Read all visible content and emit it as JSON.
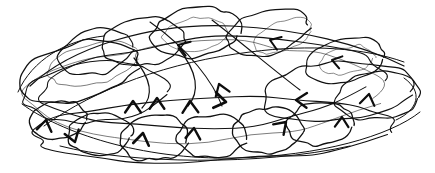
{
  "image": {
    "kind": "hand-drawn-ink-scribble",
    "title": "Scribbled tangle of overlapping loops with arrowheads",
    "width": 435,
    "height": 173,
    "background_color": "#ffffff",
    "ink_color": "#111111",
    "medium": "ballpoint pen on white paper",
    "visible_text": "",
    "loop_count": 22,
    "arrow_count": 14
  },
  "strokes": {
    "loops": [
      {
        "name": "loop-top-left-outer",
        "cx": 78,
        "cy": 72,
        "rx": 62,
        "ry": 28,
        "rot": -14,
        "w": 1.3,
        "faint": false
      },
      {
        "name": "loop-top-left-inner",
        "cx": 92,
        "cy": 64,
        "rx": 46,
        "ry": 21,
        "rot": -13,
        "w": 1.0,
        "faint": true
      },
      {
        "name": "loop-upper-left-small",
        "cx": 96,
        "cy": 52,
        "rx": 38,
        "ry": 22,
        "rot": -16,
        "w": 1.2,
        "faint": false
      },
      {
        "name": "loop-top-mid-left",
        "cx": 143,
        "cy": 42,
        "rx": 42,
        "ry": 24,
        "rot": -10,
        "w": 1.2,
        "faint": false
      },
      {
        "name": "loop-top-center",
        "cx": 196,
        "cy": 32,
        "rx": 44,
        "ry": 25,
        "rot": -7,
        "w": 1.3,
        "faint": false
      },
      {
        "name": "loop-top-center-inner",
        "cx": 196,
        "cy": 34,
        "rx": 33,
        "ry": 17,
        "rot": -7,
        "w": 0.9,
        "faint": true
      },
      {
        "name": "loop-top-right-of-center",
        "cx": 268,
        "cy": 32,
        "rx": 42,
        "ry": 22,
        "rot": -17,
        "w": 1.2,
        "faint": false
      },
      {
        "name": "loop-top-right",
        "cx": 283,
        "cy": 36,
        "rx": 31,
        "ry": 15,
        "rot": -20,
        "w": 0.9,
        "faint": true
      },
      {
        "name": "loop-right-upper",
        "cx": 345,
        "cy": 60,
        "rx": 40,
        "ry": 22,
        "rot": -12,
        "w": 1.2,
        "faint": false
      },
      {
        "name": "loop-right-upper-inner",
        "cx": 348,
        "cy": 60,
        "rx": 28,
        "ry": 14,
        "rot": -12,
        "w": 0.9,
        "faint": true
      },
      {
        "name": "loop-right-mid-big",
        "cx": 338,
        "cy": 92,
        "rx": 78,
        "ry": 30,
        "rot": -5,
        "w": 1.2,
        "faint": false
      },
      {
        "name": "loop-right-far",
        "cx": 378,
        "cy": 96,
        "rx": 42,
        "ry": 24,
        "rot": -6,
        "w": 1.2,
        "faint": false
      },
      {
        "name": "loop-center-wide",
        "cx": 210,
        "cy": 83,
        "rx": 170,
        "ry": 44,
        "rot": -4,
        "w": 1.1,
        "faint": false
      },
      {
        "name": "loop-center-wide-2",
        "cx": 205,
        "cy": 92,
        "rx": 178,
        "ry": 48,
        "rot": -2,
        "w": 1.0,
        "faint": true
      },
      {
        "name": "loop-left-mid",
        "cx": 95,
        "cy": 92,
        "rx": 72,
        "ry": 30,
        "rot": -6,
        "w": 1.1,
        "faint": false
      },
      {
        "name": "loop-bottom-left-small",
        "cx": 58,
        "cy": 120,
        "rx": 29,
        "ry": 19,
        "rot": -8,
        "w": 1.3,
        "faint": false
      },
      {
        "name": "loop-bottom-left-2",
        "cx": 100,
        "cy": 134,
        "rx": 33,
        "ry": 21,
        "rot": -5,
        "w": 1.3,
        "faint": false
      },
      {
        "name": "loop-bottom-mid-left",
        "cx": 155,
        "cy": 138,
        "rx": 35,
        "ry": 23,
        "rot": -3,
        "w": 1.3,
        "faint": false
      },
      {
        "name": "loop-bottom-center",
        "cx": 212,
        "cy": 136,
        "rx": 35,
        "ry": 22,
        "rot": -3,
        "w": 1.3,
        "faint": false
      },
      {
        "name": "loop-bottom-center-right",
        "cx": 268,
        "cy": 130,
        "rx": 36,
        "ry": 22,
        "rot": -4,
        "w": 1.3,
        "faint": false
      },
      {
        "name": "loop-bottom-right",
        "cx": 320,
        "cy": 124,
        "rx": 34,
        "ry": 21,
        "rot": -6,
        "w": 1.3,
        "faint": false
      },
      {
        "name": "loop-bottom-sweep",
        "cx": 215,
        "cy": 130,
        "rx": 180,
        "ry": 32,
        "rot": -2,
        "w": 1.1,
        "faint": false
      }
    ],
    "arcs": [
      {
        "name": "arc-sweep-upper",
        "d": "M 30 86 C 70 48 150 22 232 26 C 300 29 360 44 404 66",
        "w": 1.2
      },
      {
        "name": "arc-sweep-lower",
        "d": "M 22 104 C 60 132 140 160 235 158 C 320 156 390 136 420 112",
        "w": 1.0
      },
      {
        "name": "arc-diagonal-1",
        "d": "M 44 126 C 96 88 170 62 250 52 C 310 44 365 48 404 62",
        "w": 1.0
      },
      {
        "name": "arc-diagonal-2",
        "d": "M 150 22 C 190 50 214 84 222 106",
        "w": 1.1
      },
      {
        "name": "arc-diagonal-3",
        "d": "M 212 20 C 248 48 276 72 300 90",
        "w": 1.1
      },
      {
        "name": "arc-curl-left",
        "d": "M 18 92 C 32 60 66 40 104 36",
        "w": 1.0
      },
      {
        "name": "arc-curl-right",
        "d": "M 404 78 C 424 92 418 110 396 120",
        "w": 1.0
      },
      {
        "name": "arc-hook-center",
        "d": "M 134 58 C 152 80 154 96 142 108",
        "w": 1.2
      },
      {
        "name": "arc-hook-center-2",
        "d": "M 178 48 C 198 72 200 92 188 106",
        "w": 1.2
      },
      {
        "name": "arc-bottom-tie",
        "d": "M 60 146 C 130 164 260 166 350 146",
        "w": 1.0
      }
    ],
    "arrowheads": [
      {
        "name": "arrowhead-top-center-left",
        "x": 178,
        "y": 45,
        "angle": 200,
        "size": 13,
        "w": 2.2
      },
      {
        "name": "arrowhead-top-right",
        "x": 270,
        "y": 40,
        "angle": 200,
        "size": 12,
        "w": 2.0
      },
      {
        "name": "arrowhead-right-upper",
        "x": 332,
        "y": 60,
        "angle": 195,
        "size": 11,
        "w": 2.0
      },
      {
        "name": "arrowhead-center-diagonal",
        "x": 219,
        "y": 84,
        "angle": 250,
        "size": 13,
        "w": 2.2
      },
      {
        "name": "arrowhead-mid-left-star",
        "x": 133,
        "y": 101,
        "angle": 270,
        "size": 14,
        "w": 2.4
      },
      {
        "name": "arrowhead-mid-center-v",
        "x": 157,
        "y": 98,
        "angle": 270,
        "size": 13,
        "w": 2.4
      },
      {
        "name": "arrowhead-mid-star-2",
        "x": 190,
        "y": 101,
        "angle": 268,
        "size": 14,
        "w": 2.4
      },
      {
        "name": "arrowhead-mid-right-point",
        "x": 226,
        "y": 102,
        "angle": 10,
        "size": 14,
        "w": 2.6
      },
      {
        "name": "arrowhead-right-inward",
        "x": 296,
        "y": 100,
        "angle": 182,
        "size": 13,
        "w": 2.4
      },
      {
        "name": "arrowhead-right-v",
        "x": 342,
        "y": 117,
        "angle": 272,
        "size": 12,
        "w": 2.2
      },
      {
        "name": "arrowhead-far-right-v",
        "x": 369,
        "y": 94,
        "angle": 280,
        "size": 13,
        "w": 2.2
      },
      {
        "name": "arrowhead-bottom-left-v",
        "x": 46,
        "y": 120,
        "angle": 280,
        "size": 13,
        "w": 2.4
      },
      {
        "name": "arrowhead-bottom-left-up",
        "x": 75,
        "y": 142,
        "angle": 72,
        "size": 13,
        "w": 2.4
      },
      {
        "name": "arrowhead-bottom-center-v",
        "x": 143,
        "y": 133,
        "angle": 280,
        "size": 14,
        "w": 2.6
      },
      {
        "name": "arrowhead-bottom-center-2",
        "x": 194,
        "y": 128,
        "angle": 276,
        "size": 13,
        "w": 2.4
      },
      {
        "name": "arrowhead-bottom-right-curl",
        "x": 286,
        "y": 122,
        "angle": 315,
        "size": 13,
        "w": 2.4
      }
    ]
  }
}
